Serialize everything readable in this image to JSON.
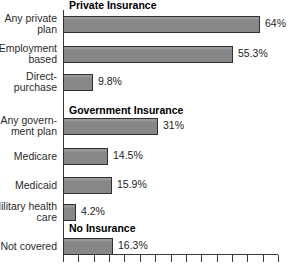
{
  "chart_data": {
    "type": "bar",
    "orientation": "horizontal",
    "title": "",
    "xlabel": "",
    "ylabel": "",
    "xlim": [
      0,
      70
    ],
    "grid": false,
    "legend": "none",
    "value_suffix": "%",
    "axis_ticks_labeled": false,
    "axis_tick_count": 15,
    "bar_color": "#8c8c8c",
    "bar_edge_color": "#303030",
    "groups": [
      {
        "heading": "Private Insurance",
        "categories": [
          "Any private\nplan",
          "Employment\nbased",
          "Direct-\npurchase"
        ],
        "values": [
          64,
          55.3,
          9.8
        ],
        "value_labels": [
          "64%",
          "55.3%",
          "9.8%"
        ]
      },
      {
        "heading": "Government Insurance",
        "categories": [
          "Any govern-\nment plan",
          "Medicare",
          "Medicaid",
          "Military health\ncare"
        ],
        "values": [
          31,
          14.5,
          15.9,
          4.2
        ],
        "value_labels": [
          "31%",
          "14.5%",
          "15.9%",
          "4.2%"
        ]
      },
      {
        "heading": "No Insurance",
        "categories": [
          "Not covered"
        ],
        "values": [
          16.3
        ],
        "value_labels": [
          "16.3%"
        ]
      }
    ],
    "categories": [
      "Any private plan",
      "Employment based",
      "Direct-purchase",
      "Any government plan",
      "Medicare",
      "Medicaid",
      "Military health care",
      "Not covered"
    ],
    "values": [
      64,
      55.3,
      9.8,
      31,
      14.5,
      15.9,
      4.2,
      16.3
    ]
  },
  "rows": [
    {
      "label": "Any private\nplan",
      "value_label": "64%",
      "value": 64,
      "lines": 2
    },
    {
      "label": "Employment\nbased",
      "value_label": "55.3%",
      "value": 55.3,
      "lines": 2
    },
    {
      "label": "Direct-\npurchase",
      "value_label": "9.8%",
      "value": 9.8,
      "lines": 2
    },
    {
      "label": "Any govern-\nment plan",
      "value_label": "31%",
      "value": 31,
      "lines": 2
    },
    {
      "label": "Medicare",
      "value_label": "14.5%",
      "value": 14.5,
      "lines": 1
    },
    {
      "label": "Medicaid",
      "value_label": "15.9%",
      "value": 15.9,
      "lines": 1
    },
    {
      "label": "Military health\ncare",
      "value_label": "4.2%",
      "value": 4.2,
      "lines": 2
    },
    {
      "label": "Not covered",
      "value_label": "16.3%",
      "value": 16.3,
      "lines": 1
    }
  ],
  "headings": [
    {
      "text": "Private Insurance",
      "top": 0
    },
    {
      "text": "Government Insurance",
      "top": 105
    },
    {
      "text": "No Insurance",
      "top": 223
    }
  ],
  "row_tops": [
    14,
    44,
    72,
    116,
    146,
    175,
    202,
    236
  ]
}
